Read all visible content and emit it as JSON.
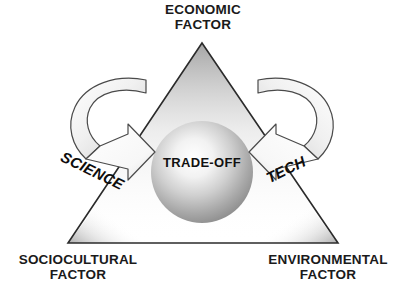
{
  "diagram": {
    "background_color": "#ffffff",
    "outline_color": "#2b2b2b",
    "text_color": "#1a1a1a"
  },
  "corners": {
    "top": {
      "label": "ECONOMIC\nFACTOR",
      "line1": "ECONOMIC",
      "line2": "FACTOR"
    },
    "bottom_left": {
      "label": "SOCIOCULTURAL\nFACTOR",
      "line1": "SOCIOCULTURAL",
      "line2": "FACTOR"
    },
    "bottom_right": {
      "label": "ENVIRONMENTAL\nFACTOR",
      "line1": "ENVIRONMENTAL",
      "line2": "FACTOR"
    }
  },
  "center": {
    "label": "TRADE-OFF",
    "shape": "sphere",
    "fill_light": "#fdfdfd",
    "fill_dark": "#8e8e8e"
  },
  "arrows": {
    "left": {
      "label": "SCIENCE",
      "direction": "curved-inward-right",
      "fill_light": "#ffffff",
      "fill_shade": "#d8d8d8"
    },
    "right": {
      "label": "TECH",
      "direction": "curved-inward-left",
      "fill_light": "#ffffff",
      "fill_shade": "#d8d8d8"
    }
  },
  "triangle": {
    "vertices": [
      {
        "name": "apex",
        "x": 202,
        "y": 43
      },
      {
        "name": "bottom-left",
        "x": 68,
        "y": 243
      },
      {
        "name": "bottom-right",
        "x": 338,
        "y": 243
      }
    ],
    "stroke_color": "#2b2b2b",
    "fill": "#ffffff"
  }
}
